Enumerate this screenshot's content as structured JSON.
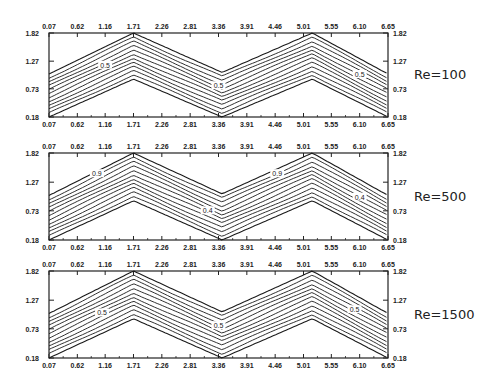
{
  "chart_data": {
    "type": "contour",
    "title": "",
    "xlabel": "",
    "ylabel": "",
    "xlim": [
      0.07,
      6.65
    ],
    "ylim": [
      0.18,
      1.82
    ],
    "x_ticks": [
      "0.07",
      "0.62",
      "1.16",
      "1.71",
      "2.26",
      "2.81",
      "3.36",
      "3.91",
      "4.46",
      "5.01",
      "5.55",
      "6.10",
      "6.65"
    ],
    "y_ticks": [
      "0.18",
      "0.73",
      "1.27",
      "1.82"
    ],
    "grid": false,
    "geometry": {
      "description": "Wavy (zigzag) channel; lower and upper walls peak near x=1.71 and x=5.2, trough near x=3.4",
      "lower_wall": [
        [
          0.07,
          0.18
        ],
        [
          1.71,
          0.92
        ],
        [
          3.43,
          0.18
        ],
        [
          5.18,
          0.92
        ],
        [
          6.65,
          0.18
        ]
      ],
      "upper_wall": [
        [
          0.07,
          1.02
        ],
        [
          1.71,
          1.82
        ],
        [
          3.43,
          1.05
        ],
        [
          5.18,
          1.82
        ],
        [
          6.65,
          1.02
        ]
      ]
    },
    "contour_levels": 11,
    "panels": [
      {
        "label": "Re=100",
        "contour_labels": [
          {
            "text": "0.5",
            "x": 1.16,
            "y": 1.18
          },
          {
            "text": "0.5",
            "x": 3.36,
            "y": 0.78
          },
          {
            "text": "0.5",
            "x": 6.1,
            "y": 1.0
          }
        ]
      },
      {
        "label": "Re=500",
        "contour_labels": [
          {
            "text": "0.9",
            "x": 1.0,
            "y": 1.42
          },
          {
            "text": "0.4",
            "x": 3.15,
            "y": 0.72
          },
          {
            "text": "0.9",
            "x": 4.5,
            "y": 1.42
          },
          {
            "text": "0.4",
            "x": 6.1,
            "y": 0.98
          }
        ]
      },
      {
        "label": "Re=1500",
        "contour_labels": [
          {
            "text": "0.5",
            "x": 1.1,
            "y": 1.02
          },
          {
            "text": "0.5",
            "x": 3.36,
            "y": 0.78
          },
          {
            "text": "0.5",
            "x": 6.0,
            "y": 1.08
          }
        ]
      }
    ]
  }
}
